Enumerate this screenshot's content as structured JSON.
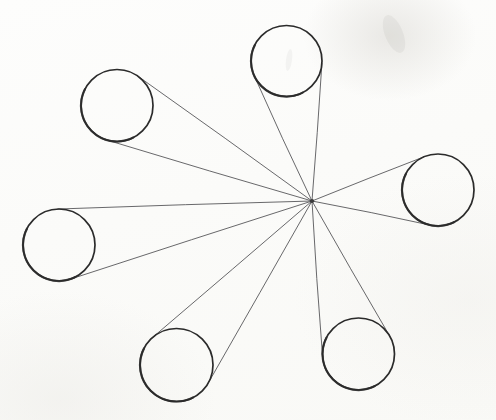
{
  "figure": {
    "canvas": {
      "width": 496,
      "height": 420
    },
    "background_color": "#fdfdfc",
    "circle_stroke_color": "#2b2b2b",
    "circle_stroke_width": 1.7,
    "circle_fill": "none",
    "tangent_stroke_color": "#4e4e52",
    "tangent_stroke_width": 0.85,
    "hub": {
      "label": "convergence-point",
      "x": 312,
      "y": 201
    },
    "circles": [
      {
        "id": "circle-top",
        "label": "top circle",
        "cx": 286.5,
        "cy": 61,
        "r": 35.5
      },
      {
        "id": "circle-upper-left",
        "label": "upper left circle",
        "cx": 117,
        "cy": 105.5,
        "r": 36
      },
      {
        "id": "circle-left",
        "label": "left circle",
        "cx": 59,
        "cy": 245,
        "r": 36
      },
      {
        "id": "circle-lower-left",
        "label": "lower left circle",
        "cx": 176.5,
        "cy": 365,
        "r": 36.5
      },
      {
        "id": "circle-lower-right",
        "label": "lower right circle",
        "cx": 358.5,
        "cy": 354,
        "r": 36
      },
      {
        "id": "circle-right",
        "label": "right circle",
        "cx": 438,
        "cy": 190,
        "r": 36
      }
    ],
    "smudges": [
      {
        "id": "smudge-top-right",
        "cx": 394,
        "cy": 34,
        "rx": 9,
        "ry": 20,
        "rotate": -22,
        "opacity": 0.1
      },
      {
        "id": "smudge-inside-top",
        "cx": 289,
        "cy": 60,
        "rx": 3,
        "ry": 11,
        "rotate": 8,
        "opacity": 0.09
      }
    ]
  },
  "chart_data": {
    "type": "scatter",
    "xlabel": "",
    "ylabel": "",
    "xlim": [
      0,
      496
    ],
    "ylim": [
      0,
      420
    ],
    "grid": false,
    "legend": "none",
    "annotations": [
      "Central convergence point at (312, 201)",
      "Each of the 6 circles contributes 2 tangent lines, 12 lines total"
    ],
    "series": [
      {
        "name": "circle centers",
        "x": [
          286.5,
          117,
          59,
          176.5,
          358.5,
          438
        ],
        "y": [
          61,
          105.5,
          245,
          365,
          354,
          190
        ],
        "radii": [
          35.5,
          36,
          36,
          36.5,
          36,
          36
        ]
      },
      {
        "name": "hub",
        "x": [
          312
        ],
        "y": [
          201
        ]
      }
    ]
  }
}
